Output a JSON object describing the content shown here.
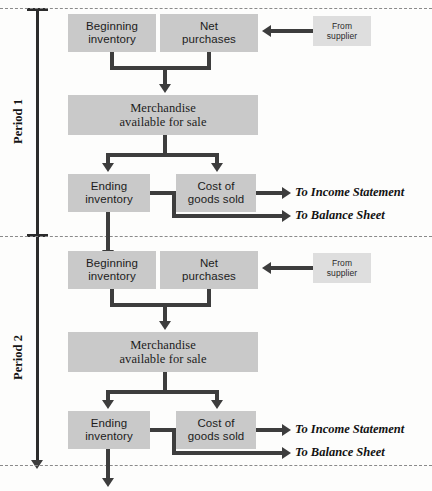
{
  "diagram": {
    "type": "flowchart",
    "box_color": "#c9c9c9",
    "light_box_color": "#dedede",
    "connector_color": "#3d3d3d",
    "axis_color": "#2b2b2b",
    "separator_color": "#8a8a8a"
  },
  "periods": [
    {
      "label": "Period 1"
    },
    {
      "label": "Period 2"
    }
  ],
  "period1": {
    "beginning_inventory": "Beginning\ninventory",
    "beginning_inventory_line1": "Beginning",
    "beginning_inventory_line2": "inventory",
    "net_purchases_line1": "Net",
    "net_purchases_line2": "purchases",
    "from_supplier_line1": "From",
    "from_supplier_line2": "supplier",
    "merchandise_line1": "Merchandise",
    "merchandise_line2": "available for sale",
    "ending_inventory_line1": "Ending",
    "ending_inventory_line2": "inventory",
    "cogs_line1": "Cost of",
    "cogs_line2": "goods sold",
    "to_income_statement": "To Income Statement",
    "to_balance_sheet": "To Balance Sheet"
  },
  "period2": {
    "beginning_inventory_line1": "Beginning",
    "beginning_inventory_line2": "inventory",
    "net_purchases_line1": "Net",
    "net_purchases_line2": "purchases",
    "from_supplier_line1": "From",
    "from_supplier_line2": "supplier",
    "merchandise_line1": "Merchandise",
    "merchandise_line2": "available for sale",
    "ending_inventory_line1": "Ending",
    "ending_inventory_line2": "inventory",
    "cogs_line1": "Cost of",
    "cogs_line2": "goods sold",
    "to_income_statement": "To Income Statement",
    "to_balance_sheet": "To Balance Sheet"
  }
}
